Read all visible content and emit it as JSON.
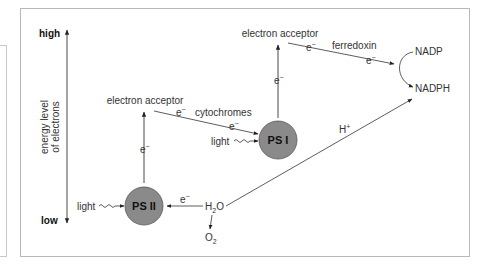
{
  "diagram": {
    "axis": {
      "high_label": "high",
      "low_label": "low",
      "title_line1": "energy level",
      "title_line2": "of electrons"
    },
    "ps2": {
      "label": "PS II",
      "light_label": "light"
    },
    "ps1": {
      "label": "PS I",
      "light_label": "light"
    },
    "acceptor1": {
      "label": "electron acceptor"
    },
    "acceptor2": {
      "label": "electron acceptor"
    },
    "cytochromes_label": "cytochromes",
    "ferredoxin_label": "ferredoxin",
    "electron": {
      "base": "e",
      "charge": "−"
    },
    "water": {
      "base": "H",
      "sub": "2",
      "tail": "O"
    },
    "oxygen": {
      "base": "O",
      "sub": "2"
    },
    "proton": {
      "base": "H",
      "charge": "+"
    },
    "nadp_label": "NADP",
    "nadph_label": "NADPH",
    "colors": {
      "circle_fill": "#8a8a8a",
      "circle_stroke": "#555555",
      "line": "#333333",
      "frame": "#b8b8b8"
    }
  }
}
